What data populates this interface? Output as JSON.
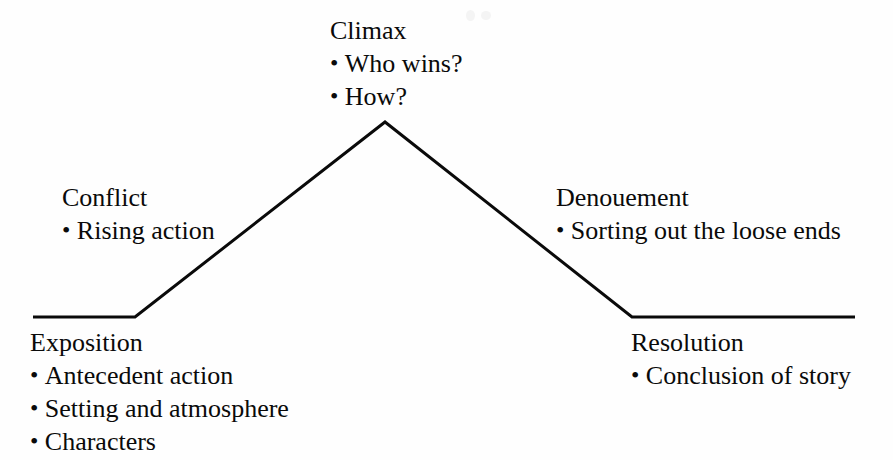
{
  "diagram": {
    "type": "plot-structure-pyramid",
    "line_color": "#0a0a0a",
    "background_color": "#fefefe",
    "text_color": "#0a0a0a",
    "line_width": 3,
    "points": [
      {
        "name": "left-baseline-start",
        "x": 33,
        "y": 317
      },
      {
        "name": "exposition-knee",
        "x": 135,
        "y": 317
      },
      {
        "name": "climax-apex",
        "x": 385,
        "y": 122
      },
      {
        "name": "resolution-knee",
        "x": 632,
        "y": 317
      },
      {
        "name": "right-baseline-end",
        "x": 855,
        "y": 317
      }
    ],
    "stages": [
      {
        "id": "climax",
        "title": "Climax",
        "bullets": [
          "Who wins?",
          "How?"
        ]
      },
      {
        "id": "conflict",
        "title": "Conflict",
        "bullets": [
          "Rising action"
        ]
      },
      {
        "id": "denouement",
        "title": "Denouement",
        "bullets": [
          "Sorting out the loose ends"
        ]
      },
      {
        "id": "exposition",
        "title": "Exposition",
        "bullets": [
          "Antecedent action",
          "Setting and atmosphere",
          "Characters"
        ]
      },
      {
        "id": "resolution",
        "title": "Resolution",
        "bullets": [
          "Conclusion of story"
        ]
      }
    ]
  }
}
